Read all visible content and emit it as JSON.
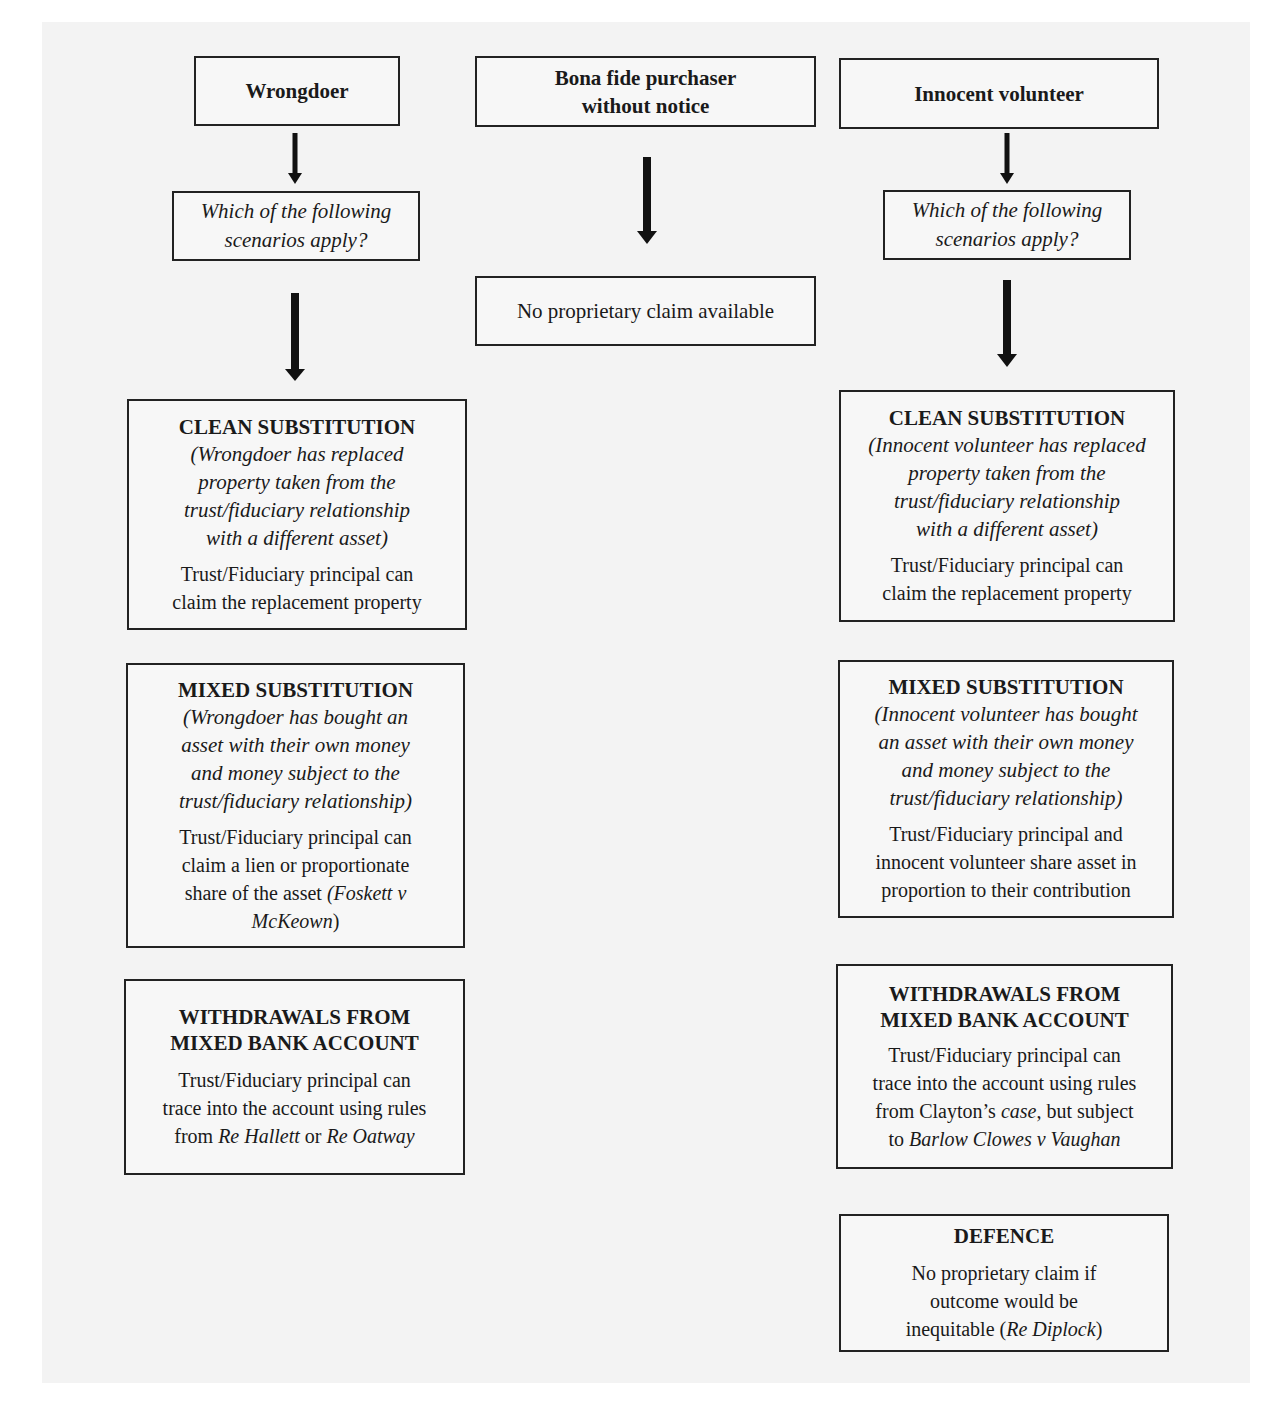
{
  "columns": {
    "wrongdoer": {
      "header": "Wrongdoer",
      "question": [
        "Which of the following",
        "scenarios apply?"
      ],
      "clean": {
        "title": "CLEAN SUBSTITUTION",
        "sub": [
          "(Wrongdoer has replaced",
          "property taken from the",
          "trust/fiduciary relationship",
          "with a different asset)"
        ],
        "body": [
          "Trust/Fiduciary principal can",
          "claim the replacement property"
        ]
      },
      "mixed": {
        "title": "MIXED SUBSTITUTION",
        "sub": [
          "(Wrongdoer has bought an",
          "asset with their own money",
          "and money subject to the",
          "trust/fiduciary relationship)"
        ],
        "body_line1": "Trust/Fiduciary principal can",
        "body_line2": "claim a lien or proportionate",
        "body_line3_plain": "share of the asset ",
        "body_line3_italic": "(Foskett v",
        "body_line4_italic": "McKeown",
        "body_line4_plain": ")"
      },
      "withdrawals": {
        "title": [
          "WITHDRAWALS FROM",
          "MIXED BANK ACCOUNT"
        ],
        "body_line1": "Trust/Fiduciary principal can",
        "body_line2": "trace into the account using rules",
        "body_line3_a": "from ",
        "body_line3_b": "Re Hallett",
        "body_line3_c": " or ",
        "body_line3_d": "Re Oatway"
      }
    },
    "bona_fide": {
      "header": [
        "Bona fide purchaser",
        "without notice"
      ],
      "result": "No proprietary claim available"
    },
    "innocent_volunteer": {
      "header": "Innocent volunteer",
      "question": [
        "Which of the following",
        "scenarios apply?"
      ],
      "clean": {
        "title": "CLEAN SUBSTITUTION",
        "sub": [
          "(Innocent volunteer has replaced",
          "property taken from the",
          "trust/fiduciary relationship",
          "with a different asset)"
        ],
        "body": [
          "Trust/Fiduciary principal can",
          "claim the replacement property"
        ]
      },
      "mixed": {
        "title": "MIXED SUBSTITUTION",
        "sub": [
          "(Innocent volunteer has bought",
          "an asset with their own money",
          "and money subject to the",
          "trust/fiduciary relationship)"
        ],
        "body": [
          "Trust/Fiduciary principal and",
          "innocent volunteer share asset in",
          "proportion to their contribution"
        ]
      },
      "withdrawals": {
        "title": [
          "WITHDRAWALS FROM",
          "MIXED BANK ACCOUNT"
        ],
        "body_line1": "Trust/Fiduciary principal can",
        "body_line2": "trace into the account using rules",
        "body_line3_a": "from Clayton’s ",
        "body_line3_b": "case",
        "body_line3_c": ", but subject",
        "body_line4_a": "to ",
        "body_line4_b": "Barlow Clowes v Vaughan"
      },
      "defence": {
        "title": "DEFENCE",
        "body_line1": "No proprietary claim if",
        "body_line2": "outcome would be",
        "body_line3_a": "inequitable (",
        "body_line3_b": "Re Diplock",
        "body_line3_c": ")"
      }
    }
  },
  "colors": {
    "page_background": "#ffffff",
    "scan_background": "#f3f3f3",
    "box_border": "#222222",
    "arrow": "#111111"
  }
}
